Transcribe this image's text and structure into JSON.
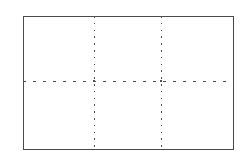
{
  "figure": {
    "title": "",
    "background_color": "#ffffff",
    "canvas": {
      "width": 248,
      "height": 162
    },
    "frame": {
      "name": "outer-rectangle",
      "x": 23,
      "y": 16,
      "width": 211,
      "height": 134,
      "stroke_color": "#4a4a4a",
      "stroke_width": 1.4,
      "fill": "none",
      "line_style": "solid"
    },
    "grid": {
      "line_color": "#4f4f4f",
      "line_width": 1.2,
      "vertical": {
        "line_style": "dotted",
        "dash_pattern": "1.6 5.2",
        "count": 2,
        "x_positions": [
          94,
          161
        ],
        "y_start": 16,
        "y_end": 150
      },
      "horizontal": {
        "line_style": "dashed",
        "dash_pattern": "3.2 6.8",
        "count": 1,
        "y_positions": [
          81
        ],
        "x_start": 23,
        "x_end": 234
      },
      "cells": {
        "columns": 3,
        "rows": 2,
        "total": 6
      }
    },
    "intersections": [
      {
        "name": "intersection-left",
        "x": 94,
        "y": 81
      },
      {
        "name": "intersection-right",
        "x": 161,
        "y": 81
      }
    ]
  },
  "chart_data": {
    "type": "table",
    "title": "",
    "subtitle": "",
    "xlabel": "",
    "ylabel": "",
    "grid": true,
    "legend": null,
    "annotations": [],
    "columns": 3,
    "rows": 2,
    "categories": [],
    "values": [],
    "cells": [
      [
        "",
        "",
        ""
      ],
      [
        "",
        "",
        ""
      ]
    ],
    "xlim": [
      23,
      234
    ],
    "ylim": [
      16,
      150
    ],
    "xticks": [
      94,
      161
    ],
    "yticks": [
      81
    ],
    "xticklabels": [],
    "yticklabels": []
  }
}
